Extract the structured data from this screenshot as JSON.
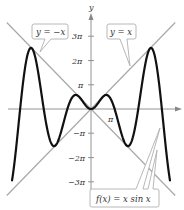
{
  "chart_data": {
    "type": "line",
    "title": "",
    "xlabel": "",
    "ylabel": "y",
    "xlim": [
      -12.1,
      12.3
    ],
    "ylim": [
      -13,
      13.5
    ],
    "grid": false,
    "y_ticks": [
      {
        "value": 9.42,
        "label": "3π"
      },
      {
        "value": 6.28,
        "label": "2π"
      },
      {
        "value": 3.14,
        "label": "π"
      },
      {
        "value": -3.14,
        "label": "−π"
      },
      {
        "value": -6.28,
        "label": "−2π"
      },
      {
        "value": -9.42,
        "label": "−3π"
      }
    ],
    "x_ticks": [
      {
        "value": 3.14,
        "label": "π"
      }
    ],
    "series": [
      {
        "name": "f(x) = x sin x",
        "function": "x*sin(x)",
        "domain": [
          -10.5,
          10.5
        ],
        "color": "#111111",
        "width": 2.2
      },
      {
        "name": "y = x",
        "function": "x",
        "domain": [
          -11.2,
          11.2
        ],
        "color": "#a8a8a8",
        "width": 1.2
      },
      {
        "name": "y = −x",
        "function": "-x",
        "domain": [
          -11.2,
          11.2
        ],
        "color": "#a8a8a8",
        "width": 1.2
      }
    ],
    "annotations": [
      {
        "text": "y = −x",
        "target": "y = −x"
      },
      {
        "text": "y = x",
        "target": "y = x"
      },
      {
        "text": "f(x) = x sin x",
        "target": "f(x) = x sin x and y = −x"
      }
    ]
  },
  "labels": {
    "y_axis": "y",
    "callout_neg": "y = −x",
    "callout_pos": "y = x",
    "callout_f": "f(x) = x sin x",
    "x_pi": "π",
    "y_3pi": "3π",
    "y_2pi": "2π",
    "y_pi": "π",
    "y_neg_pi": "−π",
    "y_neg_2pi": "−2π",
    "y_neg_3pi": "−3π"
  },
  "colors": {
    "curve": "#111111",
    "asymptote_lines": "#a8a8a8",
    "axis": "#888888",
    "callout_border": "#b0b0b0",
    "callout_fill": "#ffffff"
  }
}
